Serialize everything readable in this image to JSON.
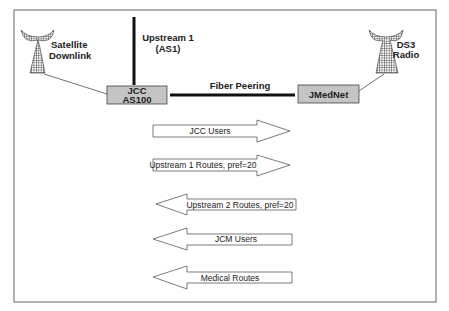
{
  "colors": {
    "node_fill": "#c4c4c4",
    "stroke": "#222222",
    "frame": "#666666"
  },
  "nodes": {
    "jcc": {
      "line1": "JCC",
      "line2": "AS100"
    },
    "jmednet": {
      "label": "JMedNet"
    }
  },
  "antennas": {
    "satellite": {
      "line1": "Satellite",
      "line2": "Downlink",
      "icon": "satellite-dish-icon"
    },
    "ds3": {
      "line1": "DS3",
      "line2": "Radio",
      "icon": "radio-tower-icon"
    }
  },
  "links": {
    "upstream1": {
      "line1": "Upstream 1",
      "line2": "(AS1)"
    },
    "fiber": {
      "label": "Fiber Peering"
    }
  },
  "arrows": [
    {
      "label": "JCC Users",
      "direction": "right"
    },
    {
      "label": "Upstream 1 Routes, pref=20",
      "direction": "right"
    },
    {
      "label": "Upstream 2 Routes, pref=20",
      "direction": "left"
    },
    {
      "label": "JCM Users",
      "direction": "left"
    },
    {
      "label": "Medical Routes",
      "direction": "left"
    }
  ]
}
